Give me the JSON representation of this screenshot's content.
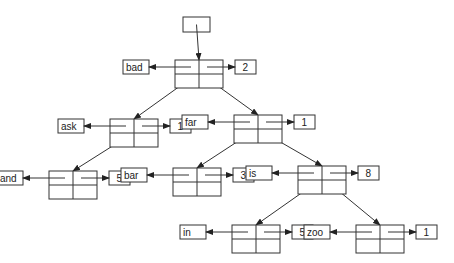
{
  "diagram": {
    "type": "binary search tree with counts",
    "root_pointer": {
      "x": 183,
      "y": 17,
      "w": 27,
      "h": 15
    },
    "nodes": [
      {
        "id": "bad",
        "key": "bad",
        "count": "2",
        "x": 175,
        "y": 60,
        "parent": null
      },
      {
        "id": "ask",
        "key": "ask",
        "count": "1",
        "x": 110,
        "y": 119,
        "parent": "bad"
      },
      {
        "id": "far",
        "key": "far",
        "count": "1",
        "x": 234,
        "y": 115,
        "parent": "bad"
      },
      {
        "id": "and",
        "key": "and",
        "count": "5",
        "x": 49,
        "y": 171,
        "parent": "ask"
      },
      {
        "id": "bar",
        "key": "bar",
        "count": "3",
        "x": 173,
        "y": 168,
        "parent": "far"
      },
      {
        "id": "is",
        "key": "is",
        "count": "8",
        "x": 298,
        "y": 166,
        "parent": "far"
      },
      {
        "id": "in",
        "key": "in",
        "count": "5",
        "x": 232,
        "y": 225,
        "parent": "is"
      },
      {
        "id": "zoo",
        "key": "zoo",
        "count": "1",
        "x": 356,
        "y": 225,
        "parent": "is"
      }
    ],
    "colors": {
      "line": "#333333",
      "background": "#ffffff"
    }
  }
}
